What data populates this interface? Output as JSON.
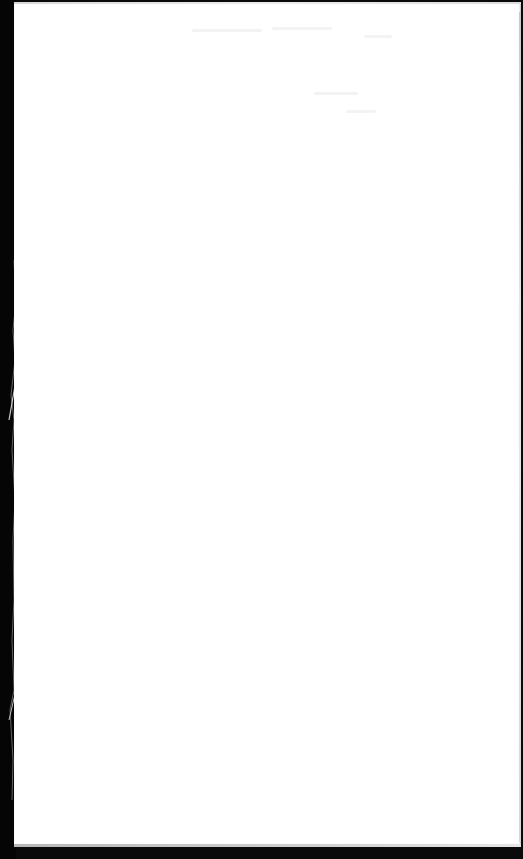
{
  "document": {
    "type": "scanned-page",
    "orientation": "portrait",
    "header_text": "",
    "header_note_line1": "",
    "header_note_line2": "",
    "body_text": ""
  },
  "colors": {
    "paper": "#ffffff",
    "background_edge": "#050505",
    "edge_shadow": "#bdbdbd"
  }
}
